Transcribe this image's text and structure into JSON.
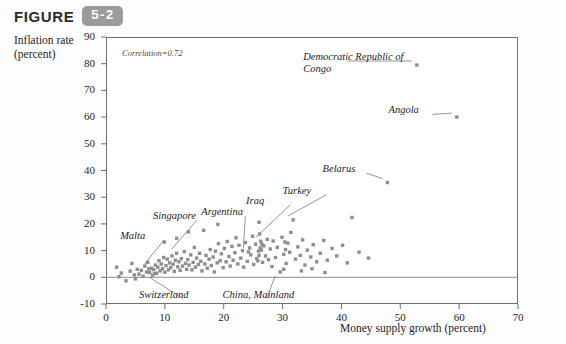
{
  "header": {
    "figure_word": "FIGURE",
    "figure_number": "5-2"
  },
  "axes": {
    "ylabel_line1": "Inflation rate",
    "ylabel_line2": "(percent)",
    "xlabel": "Money supply growth (percent)"
  },
  "annotation": {
    "correlation": "Correlation=0.72"
  },
  "chart_data": {
    "type": "scatter",
    "title": "",
    "xlabel": "Money supply growth (percent)",
    "ylabel": "Inflation rate (percent)",
    "xlim": [
      0,
      70
    ],
    "ylim": [
      -10,
      90
    ],
    "xticks": [
      0,
      10,
      20,
      30,
      40,
      50,
      60,
      70
    ],
    "yticks": [
      -10,
      0,
      10,
      20,
      30,
      40,
      50,
      60,
      70,
      80,
      90
    ],
    "grid": false,
    "legend": "none",
    "correlation": 0.72,
    "marker": {
      "shape": "square",
      "color": "#8e8e8e",
      "size": 3.4
    },
    "zero_line": {
      "y": 0,
      "color": "#8e8e8e"
    },
    "annotations": [
      {
        "text": "Democratic Republic of Congo",
        "label_x": 33.5,
        "label_y": 82.5,
        "point_x": 52.8,
        "point_y": 79.5,
        "two_line": true
      },
      {
        "text": "Angola",
        "label_x": 48.0,
        "label_y": 62.5,
        "point_x": 59.6,
        "point_y": 60.0,
        "two_line": false
      },
      {
        "text": "Belarus",
        "label_x": 36.8,
        "label_y": 40.5,
        "point_x": 47.8,
        "point_y": 35.5,
        "two_line": false
      },
      {
        "text": "Turkey",
        "label_x": 30.0,
        "label_y": 32.5,
        "point_x": 31.8,
        "point_y": 21.5,
        "two_line": false
      },
      {
        "text": "Iraq",
        "label_x": 23.8,
        "label_y": 28.5,
        "point_x": 26.3,
        "point_y": 13.5,
        "two_line": false
      },
      {
        "text": "Argentina",
        "label_x": 16.2,
        "label_y": 24.5,
        "point_x": 24.2,
        "point_y": 9.5,
        "two_line": false
      },
      {
        "text": "Singapore",
        "label_x": 8.0,
        "label_y": 23.0,
        "point_x": 12.0,
        "point_y": 9.0,
        "two_line": false
      },
      {
        "text": "Malta",
        "label_x": 2.4,
        "label_y": 15.5,
        "point_x": 7.3,
        "point_y": 3.2,
        "two_line": false
      },
      {
        "text": "Switzerland",
        "label_x": 5.6,
        "label_y": -6.5,
        "point_x": 8.3,
        "point_y": 1.4,
        "two_line": false
      },
      {
        "text": "China, Mainland",
        "label_x": 19.8,
        "label_y": -6.5,
        "point_x": 29.6,
        "point_y": 2.0,
        "two_line": false
      }
    ],
    "points": [
      {
        "x": 52.8,
        "y": 79.5
      },
      {
        "x": 59.6,
        "y": 60.0
      },
      {
        "x": 47.8,
        "y": 35.5
      },
      {
        "x": 41.8,
        "y": 22.4
      },
      {
        "x": 31.8,
        "y": 21.5
      },
      {
        "x": 26.3,
        "y": 13.5
      },
      {
        "x": 24.2,
        "y": 9.5
      },
      {
        "x": 12.0,
        "y": 9.0
      },
      {
        "x": 7.3,
        "y": 3.2
      },
      {
        "x": 8.3,
        "y": 1.4
      },
      {
        "x": 29.6,
        "y": 2.0
      },
      {
        "x": 2.6,
        "y": 1.6
      },
      {
        "x": 3.4,
        "y": -1.3
      },
      {
        "x": 4.1,
        "y": 2.3
      },
      {
        "x": 4.8,
        "y": 0.9
      },
      {
        "x": 5.3,
        "y": 3.0
      },
      {
        "x": 5.6,
        "y": 1.2
      },
      {
        "x": 6.0,
        "y": 2.6
      },
      {
        "x": 6.3,
        "y": 0.4
      },
      {
        "x": 6.6,
        "y": 4.2
      },
      {
        "x": 6.9,
        "y": 2.0
      },
      {
        "x": 7.1,
        "y": 5.6
      },
      {
        "x": 7.4,
        "y": 1.8
      },
      {
        "x": 7.7,
        "y": 3.4
      },
      {
        "x": 7.9,
        "y": 0.8
      },
      {
        "x": 8.1,
        "y": 2.9
      },
      {
        "x": 8.4,
        "y": 4.6
      },
      {
        "x": 8.6,
        "y": 1.5
      },
      {
        "x": 8.8,
        "y": 3.8
      },
      {
        "x": 9.0,
        "y": 6.2
      },
      {
        "x": 9.2,
        "y": 2.4
      },
      {
        "x": 9.4,
        "y": 5.0
      },
      {
        "x": 9.6,
        "y": 3.2
      },
      {
        "x": 9.8,
        "y": 7.4
      },
      {
        "x": 10.0,
        "y": 1.9
      },
      {
        "x": 10.2,
        "y": 4.4
      },
      {
        "x": 10.4,
        "y": 6.8
      },
      {
        "x": 10.6,
        "y": 2.8
      },
      {
        "x": 10.8,
        "y": 5.4
      },
      {
        "x": 11.0,
        "y": 3.6
      },
      {
        "x": 11.2,
        "y": 8.0
      },
      {
        "x": 11.4,
        "y": 4.9
      },
      {
        "x": 11.6,
        "y": 2.2
      },
      {
        "x": 11.8,
        "y": 6.4
      },
      {
        "x": 12.2,
        "y": 3.9
      },
      {
        "x": 12.4,
        "y": 5.8
      },
      {
        "x": 12.6,
        "y": 2.6
      },
      {
        "x": 12.8,
        "y": 7.0
      },
      {
        "x": 13.0,
        "y": 4.2
      },
      {
        "x": 13.3,
        "y": 9.6
      },
      {
        "x": 13.5,
        "y": 5.2
      },
      {
        "x": 13.7,
        "y": 3.0
      },
      {
        "x": 13.9,
        "y": 6.6
      },
      {
        "x": 14.1,
        "y": 4.6
      },
      {
        "x": 14.4,
        "y": 8.4
      },
      {
        "x": 14.6,
        "y": 2.8
      },
      {
        "x": 14.8,
        "y": 5.6
      },
      {
        "x": 15.0,
        "y": 11.2
      },
      {
        "x": 15.2,
        "y": 3.8
      },
      {
        "x": 15.4,
        "y": 7.2
      },
      {
        "x": 15.7,
        "y": 4.8
      },
      {
        "x": 15.9,
        "y": 9.0
      },
      {
        "x": 16.1,
        "y": 6.0
      },
      {
        "x": 16.3,
        "y": 2.4
      },
      {
        "x": 16.6,
        "y": 17.6
      },
      {
        "x": 16.8,
        "y": 5.0
      },
      {
        "x": 17.0,
        "y": 8.2
      },
      {
        "x": 17.2,
        "y": 3.4
      },
      {
        "x": 17.5,
        "y": 6.8
      },
      {
        "x": 17.7,
        "y": 10.4
      },
      {
        "x": 17.9,
        "y": 4.4
      },
      {
        "x": 18.2,
        "y": 7.6
      },
      {
        "x": 18.4,
        "y": 2.0
      },
      {
        "x": 18.6,
        "y": 9.8
      },
      {
        "x": 18.9,
        "y": 5.4
      },
      {
        "x": 19.1,
        "y": 12.6
      },
      {
        "x": 19.4,
        "y": 6.2
      },
      {
        "x": 19.6,
        "y": 8.8
      },
      {
        "x": 19.9,
        "y": 3.6
      },
      {
        "x": 20.1,
        "y": 10.8
      },
      {
        "x": 20.4,
        "y": 5.8
      },
      {
        "x": 20.6,
        "y": 13.4
      },
      {
        "x": 20.9,
        "y": 7.8
      },
      {
        "x": 21.1,
        "y": 4.2
      },
      {
        "x": 21.4,
        "y": 11.6
      },
      {
        "x": 21.6,
        "y": 6.4
      },
      {
        "x": 21.9,
        "y": 9.2
      },
      {
        "x": 22.1,
        "y": 14.8
      },
      {
        "x": 22.4,
        "y": 5.0
      },
      {
        "x": 22.6,
        "y": 12.0
      },
      {
        "x": 22.9,
        "y": 7.2
      },
      {
        "x": 23.2,
        "y": 10.0
      },
      {
        "x": 23.4,
        "y": 3.8
      },
      {
        "x": 23.7,
        "y": 13.0
      },
      {
        "x": 24.0,
        "y": 6.0
      },
      {
        "x": 24.4,
        "y": 11.0
      },
      {
        "x": 24.6,
        "y": 8.4
      },
      {
        "x": 24.9,
        "y": 15.4
      },
      {
        "x": 25.1,
        "y": 4.8
      },
      {
        "x": 25.4,
        "y": 12.4
      },
      {
        "x": 25.6,
        "y": 7.0
      },
      {
        "x": 25.9,
        "y": 9.8
      },
      {
        "x": 26.1,
        "y": 16.2
      },
      {
        "x": 26.6,
        "y": 5.6
      },
      {
        "x": 26.8,
        "y": 11.8
      },
      {
        "x": 27.1,
        "y": 8.0
      },
      {
        "x": 27.4,
        "y": 14.2
      },
      {
        "x": 27.6,
        "y": 6.6
      },
      {
        "x": 27.9,
        "y": 10.6
      },
      {
        "x": 28.2,
        "y": 4.0
      },
      {
        "x": 28.4,
        "y": 13.6
      },
      {
        "x": 28.8,
        "y": 7.4
      },
      {
        "x": 29.1,
        "y": 11.2
      },
      {
        "x": 29.9,
        "y": 15.0
      },
      {
        "x": 30.2,
        "y": 8.6
      },
      {
        "x": 30.6,
        "y": 5.2
      },
      {
        "x": 30.9,
        "y": 12.8
      },
      {
        "x": 31.2,
        "y": 9.4
      },
      {
        "x": 31.4,
        "y": 16.8
      },
      {
        "x": 32.2,
        "y": 6.8
      },
      {
        "x": 32.6,
        "y": 11.4
      },
      {
        "x": 33.0,
        "y": 8.2
      },
      {
        "x": 33.4,
        "y": 14.0
      },
      {
        "x": 33.8,
        "y": 4.6
      },
      {
        "x": 34.2,
        "y": 10.2
      },
      {
        "x": 34.8,
        "y": 7.6
      },
      {
        "x": 35.2,
        "y": 12.2
      },
      {
        "x": 35.8,
        "y": 5.8
      },
      {
        "x": 36.4,
        "y": 9.0
      },
      {
        "x": 37.0,
        "y": 13.8
      },
      {
        "x": 37.6,
        "y": 6.4
      },
      {
        "x": 38.4,
        "y": 10.8
      },
      {
        "x": 39.2,
        "y": 8.0
      },
      {
        "x": 40.2,
        "y": 12.0
      },
      {
        "x": 41.0,
        "y": 5.4
      },
      {
        "x": 43.0,
        "y": 9.4
      },
      {
        "x": 44.6,
        "y": 7.2
      },
      {
        "x": 1.8,
        "y": 3.8
      },
      {
        "x": 2.2,
        "y": 0.2
      },
      {
        "x": 4.4,
        "y": 5.2
      },
      {
        "x": 5.0,
        "y": -0.6
      },
      {
        "x": 9.9,
        "y": 13.2
      },
      {
        "x": 12.0,
        "y": 14.6
      },
      {
        "x": 14.0,
        "y": 17.0
      },
      {
        "x": 19.0,
        "y": 19.8
      },
      {
        "x": 26.0,
        "y": 20.6
      },
      {
        "x": 26.2,
        "y": 11.0
      },
      {
        "x": 26.4,
        "y": 10.2
      },
      {
        "x": 26.5,
        "y": 12.4
      },
      {
        "x": 26.0,
        "y": 8.2
      },
      {
        "x": 25.8,
        "y": 6.2
      },
      {
        "x": 30.4,
        "y": 13.2
      },
      {
        "x": 30.5,
        "y": 10.4
      },
      {
        "x": 30.2,
        "y": 3.0
      },
      {
        "x": 33.2,
        "y": 2.4
      },
      {
        "x": 35.0,
        "y": 3.2
      },
      {
        "x": 37.2,
        "y": 1.8
      }
    ]
  }
}
